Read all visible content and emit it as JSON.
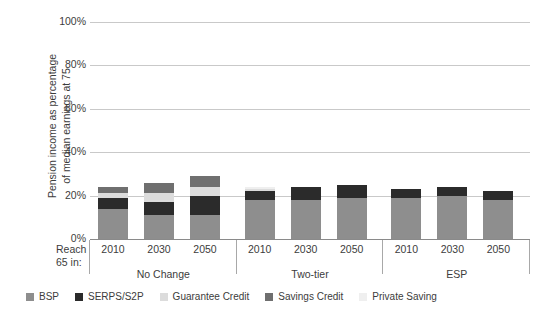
{
  "axis": {
    "y_title": "Pension income as percentage\nof median earnings at 75",
    "y_ticks": [
      "100%",
      "80%",
      "60%",
      "40%",
      "20%",
      "0%"
    ],
    "reach_label": "Reach\n65 in:"
  },
  "legend": {
    "items": [
      {
        "label": "BSP",
        "color": "#8e8e8e"
      },
      {
        "label": "SERPS/S2P",
        "color": "#2b2b2b"
      },
      {
        "label": "Guarantee Credit",
        "color": "#dcdcdc"
      },
      {
        "label": "Savings Credit",
        "color": "#6f6f6f"
      },
      {
        "label": "Private Saving",
        "color": "#efefef"
      }
    ]
  },
  "chart_data": {
    "type": "bar",
    "title": "",
    "xlabel": "",
    "ylabel": "Pension income as percentage of median earnings at 75",
    "ylim": [
      0,
      100
    ],
    "grid": true,
    "stacked": true,
    "legend_position": "bottom",
    "groups": [
      "No Change",
      "Two-tier",
      "ESP"
    ],
    "categories": [
      "2010",
      "2030",
      "2050",
      "2010",
      "2030",
      "2050",
      "2010",
      "2030",
      "2050"
    ],
    "series": [
      {
        "name": "BSP",
        "color": "#8e8e8e",
        "values": [
          14,
          11,
          11,
          18,
          18,
          19,
          19,
          20,
          18
        ]
      },
      {
        "name": "SERPS/S2P",
        "color": "#2b2b2b",
        "values": [
          5,
          6,
          9,
          4,
          6,
          6,
          4,
          4,
          4
        ]
      },
      {
        "name": "Guarantee Credit",
        "color": "#dcdcdc",
        "values": [
          2,
          4,
          4,
          1,
          0,
          0,
          0,
          0,
          0
        ]
      },
      {
        "name": "Savings Credit",
        "color": "#6f6f6f",
        "values": [
          3,
          5,
          5,
          0,
          0,
          0,
          0,
          0,
          0
        ]
      },
      {
        "name": "Private Saving",
        "color": "#efefef",
        "values": [
          0,
          0,
          0,
          1,
          0,
          0,
          0,
          0,
          0
        ]
      }
    ],
    "totals": [
      24,
      26,
      29,
      24,
      24,
      25,
      23,
      24,
      22
    ]
  }
}
